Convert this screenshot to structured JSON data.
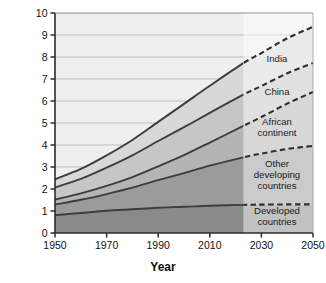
{
  "chart_data": {
    "type": "area",
    "title": "",
    "xlabel": "Year",
    "ylabel": "Human population size (billions)",
    "xlim": [
      1950,
      2050
    ],
    "ylim": [
      0,
      10
    ],
    "xticks": [
      1950,
      1970,
      1990,
      2010,
      2030,
      2050
    ],
    "yticks": [
      0,
      1,
      2,
      3,
      4,
      5,
      6,
      7,
      8,
      9,
      10
    ],
    "grid": "horizontal",
    "legend_position": "inline-right",
    "stacked": true,
    "projection_start_year": 2023,
    "x": [
      1950,
      1960,
      1970,
      1980,
      1990,
      2000,
      2010,
      2023,
      2030,
      2040,
      2050
    ],
    "series": [
      {
        "name": "Developed countries",
        "label": "Developed countries",
        "color": "#8a8a8a",
        "values": [
          0.81,
          0.91,
          1.01,
          1.08,
          1.15,
          1.19,
          1.24,
          1.28,
          1.29,
          1.3,
          1.3
        ]
      },
      {
        "name": "Other developing countries",
        "label": "Other developing countries",
        "color": "#9b9b9b",
        "values": [
          0.48,
          0.6,
          0.76,
          0.98,
          1.25,
          1.53,
          1.82,
          2.16,
          2.32,
          2.52,
          2.66
        ]
      },
      {
        "name": "African continent",
        "label": "African continent",
        "color": "#b4b4b4",
        "values": [
          0.23,
          0.29,
          0.37,
          0.48,
          0.63,
          0.82,
          1.05,
          1.43,
          1.66,
          2.06,
          2.45
        ]
      },
      {
        "name": "China",
        "label": "China",
        "color": "#c6c6c6",
        "values": [
          0.55,
          0.66,
          0.83,
          0.99,
          1.15,
          1.27,
          1.35,
          1.42,
          1.41,
          1.38,
          1.32
        ]
      },
      {
        "name": "India",
        "label": "India",
        "color": "#d8d8d8",
        "values": [
          0.37,
          0.45,
          0.56,
          0.7,
          0.87,
          1.06,
          1.23,
          1.43,
          1.5,
          1.59,
          1.64
        ]
      }
    ],
    "totals": [
      2.44,
      2.91,
      3.53,
      4.23,
      5.05,
      5.87,
      6.69,
      7.72,
      8.18,
      8.85,
      9.37
    ],
    "band_labels": [
      "India",
      "China",
      "African continent",
      "Other developing countries",
      "Developed countries"
    ],
    "legend_items": [
      {
        "label": "India",
        "lines": [
          "India"
        ]
      },
      {
        "label": "China",
        "lines": [
          "China"
        ]
      },
      {
        "label": "African continent",
        "lines": [
          "African",
          "continent"
        ]
      },
      {
        "label": "Other developing countries",
        "lines": [
          "Other",
          "developing",
          "countries"
        ]
      },
      {
        "label": "Developed countries",
        "lines": [
          "Developed",
          "countries"
        ]
      }
    ],
    "colors": {
      "plot_background": "#efefef",
      "grid": "#a9a9a9",
      "axis": "#2b2b2b",
      "boundary_line": "#3d3d3d",
      "projection_overlay": "#ffffff"
    }
  },
  "axes": {
    "x_tick_labels": [
      "1950",
      "1970",
      "1990",
      "2010",
      "2030",
      "2050"
    ],
    "y_tick_labels": [
      "0",
      "1",
      "2",
      "3",
      "4",
      "5",
      "6",
      "7",
      "8",
      "9",
      "10"
    ],
    "x_title": "Year",
    "y_title": "Human population size (billions)"
  }
}
